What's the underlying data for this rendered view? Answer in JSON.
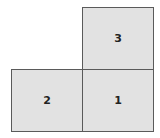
{
  "diagram": {
    "squares": [
      {
        "label": "3",
        "position": "top-right"
      },
      {
        "label": "2",
        "position": "bottom-left"
      },
      {
        "label": "1",
        "position": "bottom-right"
      }
    ],
    "colors": {
      "fill": "#e2e2e2",
      "border": "#5a5a5a"
    }
  }
}
